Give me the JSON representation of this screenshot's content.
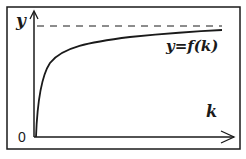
{
  "diagram": {
    "type": "function-graph",
    "axes": {
      "y_label": "y",
      "x_label": "k",
      "origin_label": "0"
    },
    "curve_label": "y=f(k)",
    "asymptote": "horizontal dashed line (upper bound)",
    "colors": {
      "ink": "#1a1a1a",
      "background": "#ffffff"
    }
  }
}
